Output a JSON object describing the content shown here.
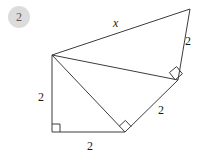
{
  "problem": {
    "number": "2"
  },
  "figure": {
    "type": "geometry-diagram",
    "stroke_color": "#3c3c3c",
    "fill_color": "none",
    "badge_color": "#dcdcdc",
    "vertices": {
      "apex_top_left": [
        52,
        55
      ],
      "top_right": [
        190,
        9
      ],
      "right": [
        178,
        80
      ],
      "bottom_middle": [
        125,
        132
      ],
      "bottom_left": [
        52,
        132
      ]
    },
    "edges": [
      {
        "name": "x-side",
        "from": "apex_top_left",
        "to": "top_right",
        "label": "x"
      },
      {
        "name": "right-upper-side",
        "from": "top_right",
        "to": "right",
        "label": "2"
      },
      {
        "name": "right-lower-side",
        "from": "right",
        "to": "bottom_middle",
        "label": "2"
      },
      {
        "name": "bottom-side",
        "from": "bottom_middle",
        "to": "bottom_left",
        "label": "2"
      },
      {
        "name": "left-side",
        "from": "bottom_left",
        "to": "apex_top_left",
        "label": "2"
      },
      {
        "name": "interior-diagonal-upper",
        "from": "apex_top_left",
        "to": "right",
        "label": ""
      },
      {
        "name": "interior-diagonal-lower",
        "from": "apex_top_left",
        "to": "bottom_middle",
        "label": ""
      }
    ],
    "right_angles": [
      {
        "name": "right-angle-bottom-left",
        "at": "bottom_left"
      },
      {
        "name": "right-angle-bottom-middle",
        "at": "bottom_middle"
      },
      {
        "name": "right-angle-right",
        "at": "right"
      }
    ],
    "labels": [
      {
        "name": "label-x-top",
        "text": "x",
        "x": 113,
        "y": 17,
        "italic": true
      },
      {
        "name": "label-2-right-upper",
        "text": "2",
        "x": 185,
        "y": 35,
        "italic": false
      },
      {
        "name": "label-2-right-lower",
        "text": "2",
        "x": 158,
        "y": 104,
        "italic": false
      },
      {
        "name": "label-2-bottom",
        "text": "2",
        "x": 87,
        "y": 140,
        "italic": false
      },
      {
        "name": "label-2-left",
        "text": "2",
        "x": 38,
        "y": 91,
        "italic": false
      }
    ]
  }
}
